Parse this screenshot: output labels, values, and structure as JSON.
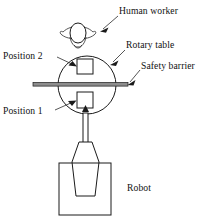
{
  "figure": {
    "background_color": "#ffffff",
    "line_color": "#1a1a1a",
    "barrier_color": "#8d8d8d",
    "width": 208,
    "height": 216
  },
  "labels": {
    "human_worker": "Human worker",
    "rotary_table": "Rotary table",
    "safety_barrier": "Safety barrier",
    "position_2": "Position 2",
    "position_1": "Position 1",
    "robot": "Robot"
  },
  "components": [
    {
      "name": "human-worker",
      "label": "Human worker",
      "shape": "top-view person with outstretched arms"
    },
    {
      "name": "rotary-table",
      "label": "Rotary table",
      "shape": "circle"
    },
    {
      "name": "safety-barrier",
      "label": "Safety barrier",
      "shape": "horizontal bar across table centre"
    },
    {
      "name": "position-2",
      "label": "Position 2",
      "shape": "square fixture, upper half of table"
    },
    {
      "name": "position-1",
      "label": "Position 1",
      "shape": "square fixture, lower half of table"
    },
    {
      "name": "robot",
      "label": "Robot",
      "shape": "arm with tapered body on rectangular base"
    }
  ],
  "icons": {
    "leader_arrow": "arrow-head",
    "robot_arrow": "up-arrow"
  }
}
